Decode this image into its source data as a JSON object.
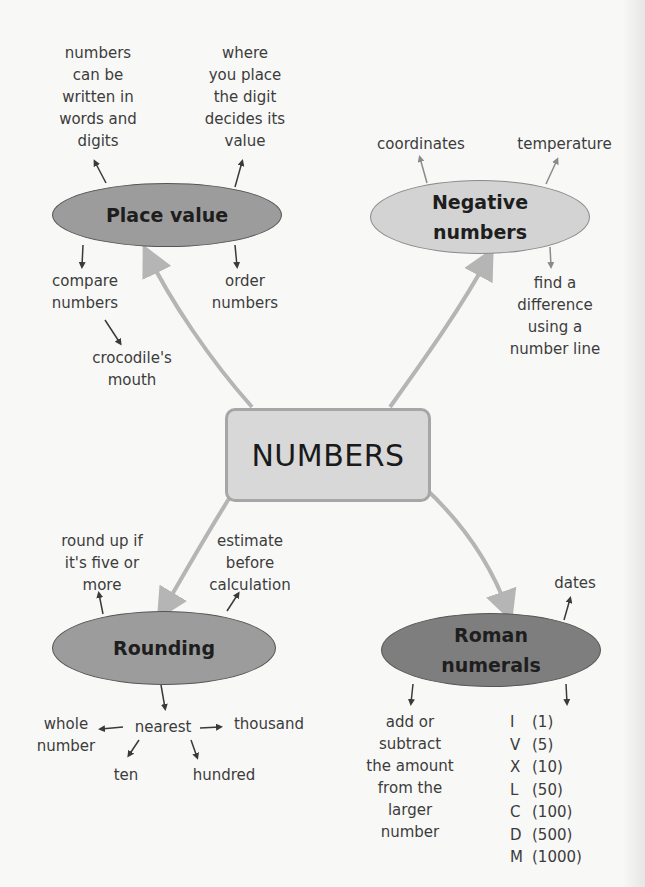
{
  "center": {
    "label": "NUMBERS"
  },
  "place_value": {
    "label": "Place value",
    "fill": "#9c9c9c",
    "branches": {
      "numbers_words": [
        "numbers",
        "can be",
        "written in",
        "words and",
        "digits"
      ],
      "where_place": [
        "where",
        "you place",
        "the digit",
        "decides its",
        "value"
      ],
      "compare": [
        "compare",
        "numbers"
      ],
      "order": [
        "order",
        "numbers"
      ],
      "crocodile": [
        "crocodile's",
        "mouth"
      ]
    }
  },
  "negative_numbers": {
    "label_lines": [
      "Negative",
      "numbers"
    ],
    "fill": "#d3d3d3",
    "branches": {
      "coordinates": [
        "coordinates"
      ],
      "temperature": [
        "temperature"
      ],
      "difference": [
        "find a",
        "difference",
        "using a",
        "number line"
      ]
    }
  },
  "rounding": {
    "label": "Rounding",
    "fill": "#9c9c9c",
    "branches": {
      "round_up": [
        "round up if",
        "it's five or",
        "more"
      ],
      "estimate": [
        "estimate",
        "before",
        "calculation"
      ],
      "nearest": [
        "nearest"
      ],
      "whole_number": [
        "whole",
        "number"
      ],
      "thousand": [
        "thousand"
      ],
      "ten": [
        "ten"
      ],
      "hundred": [
        "hundred"
      ]
    }
  },
  "roman_numerals": {
    "label_lines": [
      "Roman",
      "numerals"
    ],
    "fill": "#7e7e7e",
    "branches": {
      "dates": [
        "dates"
      ],
      "add_subtract": [
        "add or",
        "subtract",
        "the amount",
        "from the",
        "larger",
        "number"
      ]
    },
    "table": [
      {
        "symbol": "I",
        "value": "(1)"
      },
      {
        "symbol": "V",
        "value": "(5)"
      },
      {
        "symbol": "X",
        "value": "(10)"
      },
      {
        "symbol": "L",
        "value": "(50)"
      },
      {
        "symbol": "C",
        "value": "(100)"
      },
      {
        "symbol": "D",
        "value": "(500)"
      },
      {
        "symbol": "M",
        "value": "(1000)"
      }
    ]
  },
  "colors": {
    "background": "#f8f8f7",
    "connector": "#b5b5b5",
    "arrow_dark": "#3a3a3a",
    "arrow_light": "#8a8a8a",
    "center_fill": "#d8d8d8",
    "center_border": "#a6a6a6"
  }
}
